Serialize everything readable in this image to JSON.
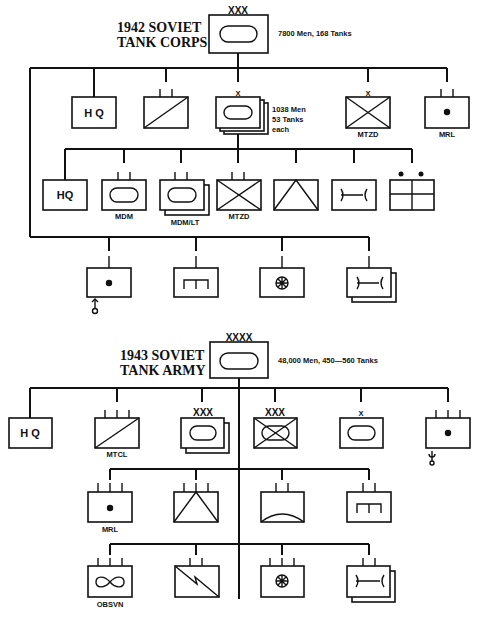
{
  "corps": {
    "title_line1": "1942 SOVIET",
    "title_line2": "TANK CORPS",
    "echelon": "XXX",
    "strength": "7800 Men, 168 Tanks",
    "brigade_note_line1": "1038 Men",
    "brigade_note_line2": "53 Tanks",
    "brigade_note_line3": "each",
    "row1": [
      {
        "symbol": "headquarters",
        "text": "H Q",
        "label": ""
      },
      {
        "symbol": "signal",
        "echelon": "II",
        "label": ""
      },
      {
        "symbol": "tank-brigade-stacked",
        "echelon": "X",
        "label": ""
      },
      {
        "symbol": "motorized-infantry",
        "echelon": "X",
        "label": "MTZD"
      },
      {
        "symbol": "rocket-artillery",
        "echelon": "II",
        "label": "MRL"
      }
    ],
    "row2": [
      {
        "symbol": "headquarters",
        "text": "HQ",
        "label": ""
      },
      {
        "symbol": "tank",
        "echelon": "II",
        "label": "MDM"
      },
      {
        "symbol": "tank-stacked",
        "echelon": "II",
        "label": "MDM/LT"
      },
      {
        "symbol": "motorized-infantry",
        "echelon": "II",
        "label": "MTZD"
      },
      {
        "symbol": "engineer-triangle",
        "echelon": "",
        "label": ""
      },
      {
        "symbol": "maintenance",
        "echelon": "",
        "label": ""
      },
      {
        "symbol": "support-dots",
        "echelon": "",
        "label": ""
      }
    ],
    "row3": [
      {
        "symbol": "anti-aircraft-artillery",
        "label": ""
      },
      {
        "symbol": "engineer",
        "label": ""
      },
      {
        "symbol": "medical-wheel",
        "label": ""
      },
      {
        "symbol": "maintenance-stacked",
        "label": ""
      }
    ]
  },
  "army": {
    "title_line1": "1943 SOVIET",
    "title_line2": "TANK ARMY",
    "echelon": "XXXX",
    "strength": "48,000 Men, 450—560 Tanks",
    "row1": [
      {
        "symbol": "headquarters",
        "text": "H Q",
        "label": ""
      },
      {
        "symbol": "signal",
        "echelon": "III",
        "label": "MTCL"
      },
      {
        "symbol": "tank-corps-stacked",
        "echelon": "XXX",
        "label": ""
      },
      {
        "symbol": "mechanized-corps",
        "echelon": "XXX",
        "label": ""
      },
      {
        "symbol": "tank-brigade",
        "echelon": "X",
        "label": ""
      },
      {
        "symbol": "artillery",
        "echelon": "III",
        "label": ""
      }
    ],
    "row2": [
      {
        "symbol": "rocket-artillery",
        "echelon": "III",
        "label": "MRL"
      },
      {
        "symbol": "engineer-triangle",
        "echelon": "III",
        "label": ""
      },
      {
        "symbol": "arc",
        "echelon": "II",
        "label": ""
      },
      {
        "symbol": "engineer",
        "echelon": "II",
        "label": ""
      }
    ],
    "row3": [
      {
        "symbol": "observation",
        "echelon": "III",
        "label": "OBSVN"
      },
      {
        "symbol": "signal-lightning",
        "echelon": "II",
        "label": ""
      },
      {
        "symbol": "medical-wheel",
        "echelon": "III",
        "label": ""
      },
      {
        "symbol": "maintenance-stacked",
        "echelon": "II",
        "label": ""
      }
    ]
  }
}
